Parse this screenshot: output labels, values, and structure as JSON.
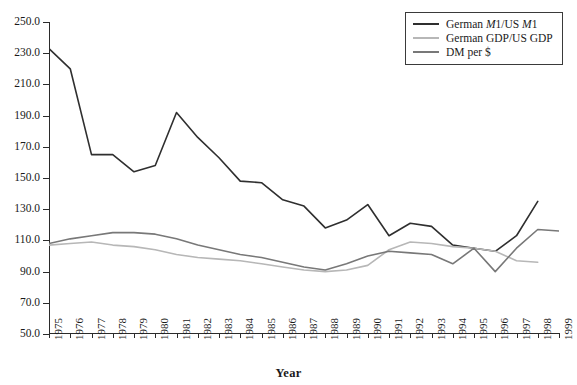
{
  "chart_data": {
    "type": "line",
    "title": "",
    "xlabel": "Year",
    "ylabel": "",
    "xlim": [
      1975,
      1999
    ],
    "ylim": [
      50.0,
      250.0
    ],
    "grid": false,
    "legend_position": "top-right",
    "x": [
      1975,
      1976,
      1977,
      1978,
      1979,
      1980,
      1981,
      1982,
      1983,
      1984,
      1985,
      1986,
      1987,
      1988,
      1989,
      1990,
      1991,
      1992,
      1993,
      1994,
      1995,
      1996,
      1997,
      1998,
      1999
    ],
    "ytick_labels": [
      "250.0",
      "230.0",
      "210.0",
      "190.0",
      "170.0",
      "150.0",
      "130.0",
      "110.0",
      "90.0",
      "70.0",
      "50.0"
    ],
    "ytick_values": [
      250,
      230,
      210,
      190,
      170,
      150,
      130,
      110,
      90,
      70,
      50
    ],
    "xtick_labels": [
      "1975",
      "1976",
      "1977",
      "1978",
      "1979",
      "1980",
      "1981",
      "1982",
      "1983",
      "1984",
      "1985",
      "1986",
      "1987",
      "1988",
      "1989",
      "1990",
      "1991",
      "1992",
      "1993",
      "1994",
      "1995",
      "1996",
      "1997",
      "1998",
      "1999"
    ],
    "series": [
      {
        "name": "German M1/US M1",
        "name_html": "German <i>M</i>1/US <i>M</i>1",
        "color": "#2f2f2f",
        "width": 1.6,
        "x": [
          1975,
          1976,
          1977,
          1978,
          1979,
          1980,
          1981,
          1982,
          1983,
          1984,
          1985,
          1986,
          1987,
          1988,
          1989,
          1990,
          1991,
          1992,
          1993,
          1994,
          1995,
          1996,
          1997,
          1998
        ],
        "values": [
          233,
          220,
          165,
          165,
          154,
          158,
          192,
          176,
          163,
          148,
          147,
          136,
          132,
          118,
          123,
          133,
          113,
          121,
          119,
          107,
          105,
          103,
          113,
          135
        ]
      },
      {
        "name": "German GDP/US GDP",
        "name_html": "German GDP/US GDP",
        "color": "#b7b7b7",
        "width": 1.6,
        "x": [
          1975,
          1976,
          1977,
          1978,
          1979,
          1980,
          1981,
          1982,
          1983,
          1984,
          1985,
          1986,
          1987,
          1988,
          1989,
          1990,
          1991,
          1992,
          1993,
          1994,
          1995,
          1996,
          1997,
          1998
        ],
        "values": [
          107,
          108,
          109,
          107,
          106,
          104,
          101,
          99,
          98,
          97,
          95,
          93,
          91,
          90,
          91,
          94,
          104,
          109,
          108,
          106,
          105,
          103,
          97,
          96
        ]
      },
      {
        "name": "DM per $",
        "name_html": "DM per $",
        "color": "#787878",
        "width": 1.6,
        "x": [
          1975,
          1976,
          1977,
          1978,
          1979,
          1980,
          1981,
          1982,
          1983,
          1984,
          1985,
          1986,
          1987,
          1988,
          1989,
          1990,
          1991,
          1992,
          1993,
          1994,
          1995,
          1996,
          1997,
          1998,
          1999
        ],
        "values": [
          108,
          111,
          113,
          115,
          115,
          114,
          111,
          107,
          104,
          101,
          99,
          96,
          93,
          91,
          95,
          100,
          103,
          102,
          101,
          95,
          105,
          90,
          105,
          117,
          116
        ]
      }
    ]
  },
  "legend": {
    "entries": [
      {
        "label": "German M1/US M1"
      },
      {
        "label": "German GDP/US GDP"
      },
      {
        "label": "DM per $"
      }
    ]
  },
  "axes": {
    "x_title": "Year"
  }
}
